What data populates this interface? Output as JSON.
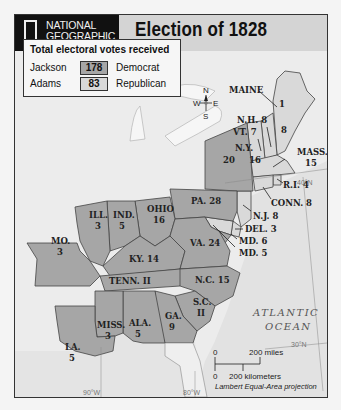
{
  "header": {
    "publisher_line1": "NATIONAL",
    "publisher_line2": "GEOGRAPHIC",
    "title": "Election of 1828"
  },
  "legend": {
    "title": "Total electoral votes received",
    "entries": [
      {
        "candidate": "Jackson",
        "votes": "178",
        "party": "Democrat",
        "color": "#a6a6a6"
      },
      {
        "candidate": "Adams",
        "votes": "83",
        "party": "Republican",
        "color": "#d9d9d9"
      }
    ]
  },
  "compass": {
    "n": "N",
    "s": "S",
    "e": "E",
    "w": "W"
  },
  "states": [
    {
      "name": "MAINE",
      "votes": "8",
      "split": "1",
      "winner": "Adams"
    },
    {
      "name": "N.H.",
      "votes": "8",
      "winner": "Adams"
    },
    {
      "name": "VT.",
      "votes": "7",
      "winner": "Adams"
    },
    {
      "name": "MASS.",
      "votes": "15",
      "winner": "Adams"
    },
    {
      "name": "R.I.",
      "votes": "4",
      "winner": "Adams"
    },
    {
      "name": "CONN.",
      "votes": "8",
      "winner": "Adams"
    },
    {
      "name": "N.Y.",
      "votes": "20",
      "split": "16",
      "winner": "Jackson"
    },
    {
      "name": "N.J.",
      "votes": "8",
      "winner": "Adams"
    },
    {
      "name": "DEL.",
      "votes": "3",
      "winner": "Adams"
    },
    {
      "name": "MD.",
      "votes": "6",
      "winner": "Adams"
    },
    {
      "name": "MD.",
      "votes": "5",
      "winner": "Jackson"
    },
    {
      "name": "PA.",
      "votes": "28",
      "winner": "Jackson"
    },
    {
      "name": "OHIO",
      "votes": "16",
      "winner": "Jackson"
    },
    {
      "name": "IND.",
      "votes": "5",
      "winner": "Jackson"
    },
    {
      "name": "ILL.",
      "votes": "3",
      "winner": "Jackson"
    },
    {
      "name": "MO.",
      "votes": "3",
      "winner": "Jackson"
    },
    {
      "name": "KY.",
      "votes": "14",
      "winner": "Jackson"
    },
    {
      "name": "VA.",
      "votes": "24",
      "winner": "Jackson"
    },
    {
      "name": "TENN.",
      "votes": "11",
      "winner": "Jackson"
    },
    {
      "name": "N.C.",
      "votes": "15",
      "winner": "Jackson"
    },
    {
      "name": "S.C.",
      "votes": "11",
      "winner": "Jackson"
    },
    {
      "name": "GA.",
      "votes": "9",
      "winner": "Jackson"
    },
    {
      "name": "ALA.",
      "votes": "5",
      "winner": "Jackson"
    },
    {
      "name": "MISS.",
      "votes": "3",
      "winner": "Jackson"
    },
    {
      "name": "LA.",
      "votes": "5",
      "winner": "Jackson"
    }
  ],
  "labels": {
    "maine": "MAINE",
    "maine_split": "1",
    "maine_votes": "8",
    "nh": "N.H. 8",
    "vt": "VT. 7",
    "mass": "MASS.",
    "mass_votes": "15",
    "ri": "R.I. 4",
    "conn": "CONN. 8",
    "ny": "N.Y.",
    "ny_a": "20",
    "ny_b": "16",
    "nj": "N.J. 8",
    "del": "DEL. 3",
    "md_a": "MD. 6",
    "md_b": "MD. 5",
    "pa": "PA. 28",
    "ohio": "OHIO",
    "ohio_votes": "16",
    "ind": "IND.",
    "ind_votes": "5",
    "ill": "ILL.",
    "ill_votes": "3",
    "mo": "MO.",
    "mo_votes": "3",
    "ky": "KY. 14",
    "va": "VA. 24",
    "tenn": "TENN. II",
    "nc": "N.C. 15",
    "sc": "S.C.",
    "sc_votes": "II",
    "ga": "GA.",
    "ga_votes": "9",
    "ala": "ALA.",
    "ala_votes": "5",
    "miss": "MISS.",
    "miss_votes": "3",
    "la": "LA.",
    "la_votes": "5"
  },
  "ocean": {
    "line1": "ATLANTIC",
    "line2": "OCEAN"
  },
  "graticule": {
    "lat40": "40°N",
    "lat30": "30°N",
    "lon90": "90°W",
    "lon80": "80°W"
  },
  "scale": {
    "zero_miles": "0",
    "miles": "200 miles",
    "zero_km": "0",
    "km": "200 kilometers",
    "projection": "Lambert Equal-Area projection"
  }
}
